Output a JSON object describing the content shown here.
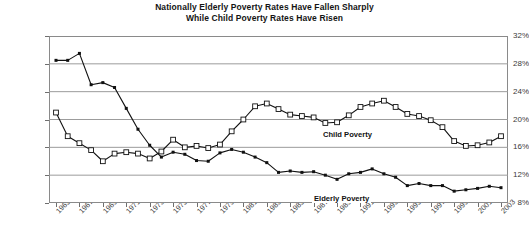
{
  "chart_data": {
    "type": "line",
    "title": "Nationally Elderly Poverty Rates Have Fallen Sharply While Child Poverty Rates Have Risen",
    "title_lines": [
      "Nationally Elderly Poverty Rates Have Fallen Sharply",
      "While Child Poverty Rates Have Risen"
    ],
    "xlabel": "",
    "ylabel": "",
    "ylim": [
      8,
      32
    ],
    "ytick_labels": [
      "32%",
      "28%",
      "24%",
      "20%",
      "16%",
      "12%",
      "8%"
    ],
    "ytick_values": [
      32,
      28,
      24,
      20,
      16,
      12,
      8
    ],
    "grid": true,
    "grid_axis": "y",
    "legend": "inline-labels",
    "x": [
      1965,
      1966,
      1967,
      1968,
      1969,
      1970,
      1971,
      1972,
      1973,
      1974,
      1975,
      1976,
      1977,
      1978,
      1979,
      1980,
      1981,
      1982,
      1983,
      1984,
      1985,
      1986,
      1987,
      1988,
      1989,
      1990,
      1991,
      1992,
      1993,
      1994,
      1995,
      1996,
      1997,
      1998,
      1999,
      2000,
      2001,
      2002,
      2003
    ],
    "xtick_labels": [
      "1965",
      "1967",
      "1969",
      "1971",
      "1973",
      "1975",
      "1977",
      "1979",
      "1981",
      "1983",
      "1985",
      "1987",
      "1989",
      "1991",
      "1993",
      "1995",
      "1997",
      "1999",
      "2001",
      "2003"
    ],
    "xtick_values": [
      1965,
      1967,
      1969,
      1971,
      1973,
      1975,
      1977,
      1979,
      1981,
      1983,
      1985,
      1987,
      1989,
      1991,
      1993,
      1995,
      1997,
      1999,
      2001,
      2003
    ],
    "series": [
      {
        "name": "Child Poverty",
        "label": "Child Poverty",
        "marker": "open-square",
        "color": "#111111",
        "values": [
          21.0,
          17.6,
          16.6,
          15.6,
          14.0,
          15.1,
          15.3,
          15.1,
          14.4,
          15.4,
          17.1,
          16.0,
          16.2,
          15.9,
          16.4,
          18.3,
          20.0,
          21.9,
          22.3,
          21.5,
          20.7,
          20.5,
          20.3,
          19.5,
          19.6,
          20.6,
          21.8,
          22.3,
          22.7,
          21.8,
          20.8,
          20.5,
          19.9,
          18.9,
          16.9,
          16.2,
          16.3,
          16.7,
          17.6
        ]
      },
      {
        "name": "Elderly Poverty",
        "label": "Elderly Poverty",
        "marker": "filled-square",
        "color": "#111111",
        "values": [
          28.5,
          28.5,
          29.5,
          25.0,
          25.3,
          24.6,
          21.6,
          18.6,
          16.3,
          14.6,
          15.3,
          15.0,
          14.1,
          14.0,
          15.2,
          15.7,
          15.3,
          14.6,
          13.8,
          12.4,
          12.6,
          12.4,
          12.5,
          12.0,
          11.4,
          12.2,
          12.4,
          12.9,
          12.2,
          11.7,
          10.5,
          10.8,
          10.5,
          10.5,
          9.7,
          9.9,
          10.1,
          10.4,
          10.2
        ]
      }
    ]
  }
}
